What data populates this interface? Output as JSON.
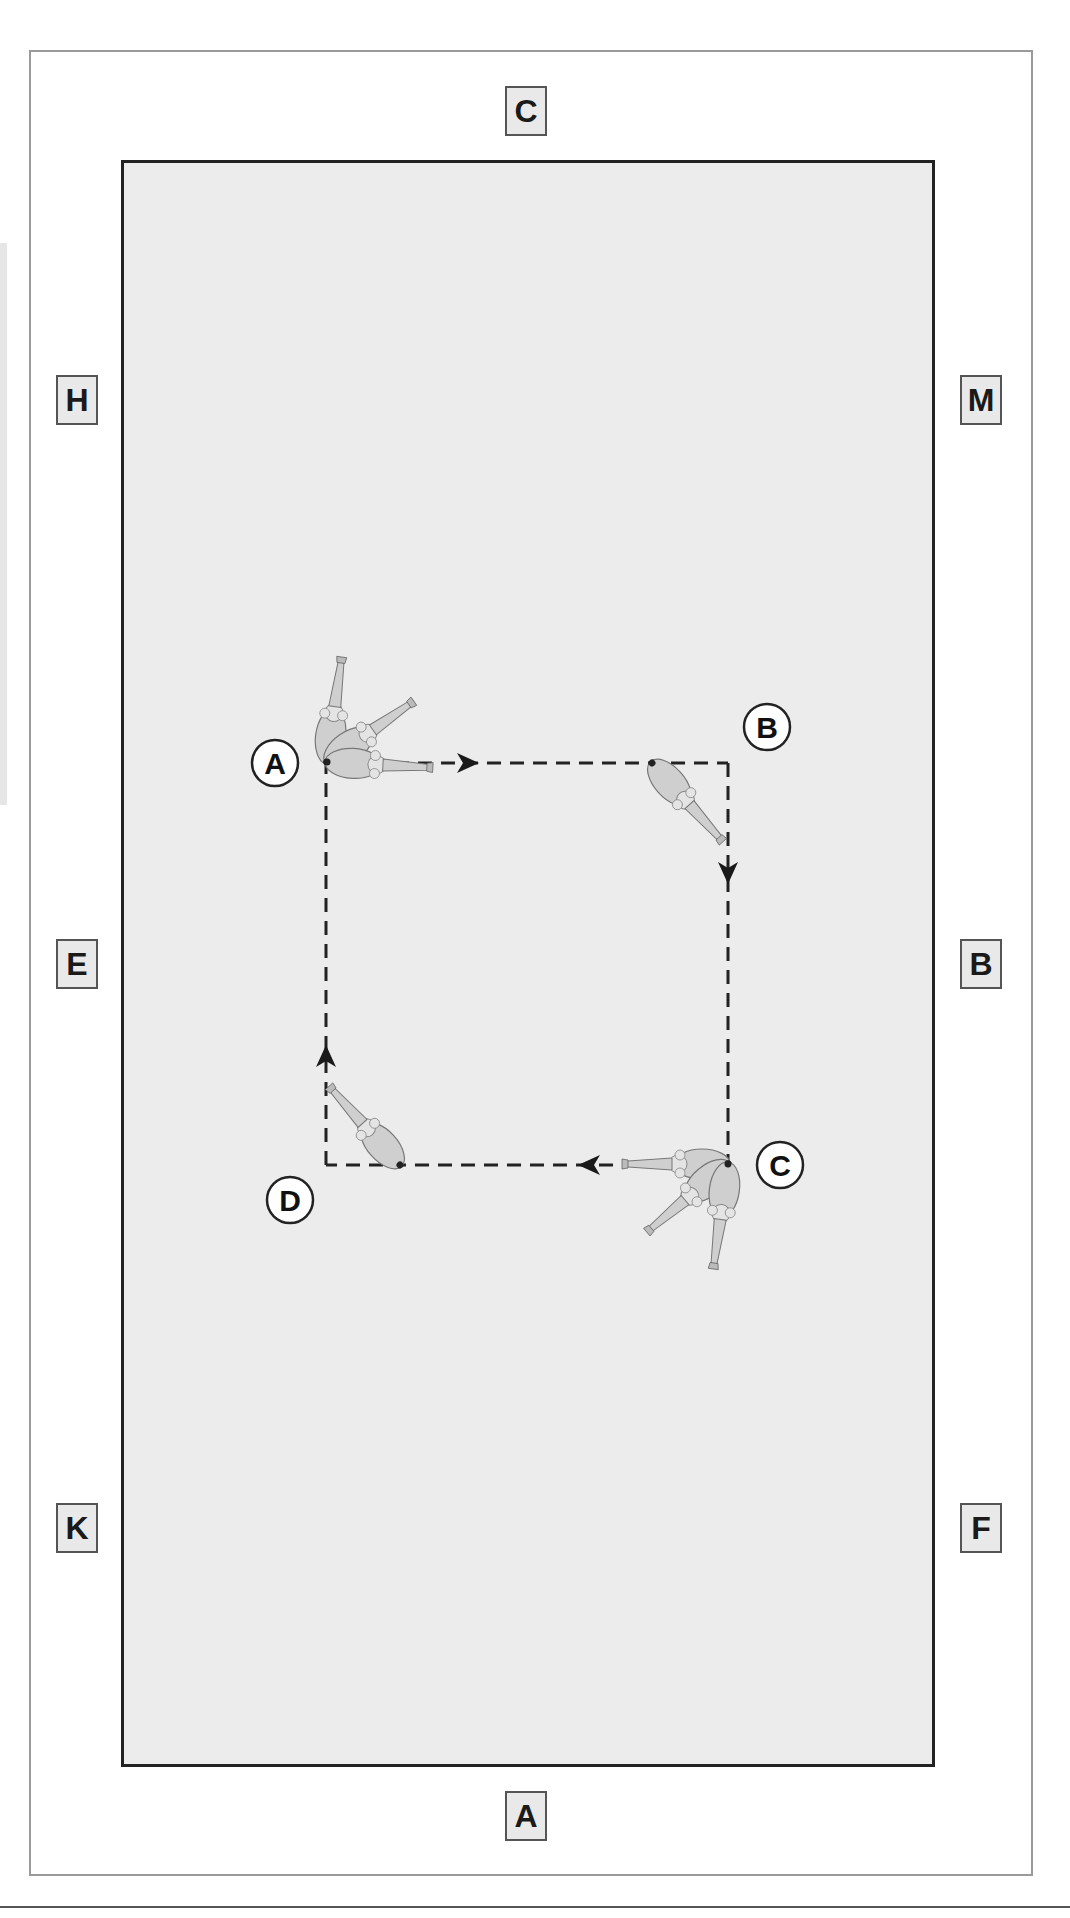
{
  "diagram": {
    "colors": {
      "arena_fill": "#ececec",
      "arena_border": "#222222",
      "outer_frame": "#9a9a9a",
      "marker_fill": "#e9e9e9",
      "path": "#222222",
      "horse": "#c8c8c8"
    },
    "arena_letters": [
      {
        "id": "C",
        "label": "C",
        "x": 505,
        "y": 86
      },
      {
        "id": "H",
        "label": "H",
        "x": 56,
        "y": 375
      },
      {
        "id": "M",
        "label": "M",
        "x": 960,
        "y": 375
      },
      {
        "id": "E",
        "label": "E",
        "x": 56,
        "y": 939
      },
      {
        "id": "B",
        "label": "B",
        "x": 960,
        "y": 939
      },
      {
        "id": "K",
        "label": "K",
        "x": 56,
        "y": 1503
      },
      {
        "id": "F",
        "label": "F",
        "x": 960,
        "y": 1503
      },
      {
        "id": "A",
        "label": "A",
        "x": 505,
        "y": 1791
      }
    ],
    "path_points": [
      {
        "id": "A",
        "label": "A",
        "cx": 275,
        "cy": 763
      },
      {
        "id": "B",
        "label": "B",
        "cx": 767,
        "cy": 727
      },
      {
        "id": "C",
        "label": "C",
        "cx": 780,
        "cy": 1165
      },
      {
        "id": "D",
        "label": "D",
        "cx": 290,
        "cy": 1200
      }
    ],
    "square_path": {
      "left": 326,
      "top": 763,
      "right": 728,
      "bottom": 1165
    },
    "direction_arrows": [
      {
        "dir": "right",
        "x": 467,
        "y": 763
      },
      {
        "dir": "down",
        "x": 728,
        "y": 872
      },
      {
        "dir": "left",
        "x": 590,
        "y": 1165
      },
      {
        "dir": "up",
        "x": 326,
        "y": 1057
      }
    ]
  }
}
